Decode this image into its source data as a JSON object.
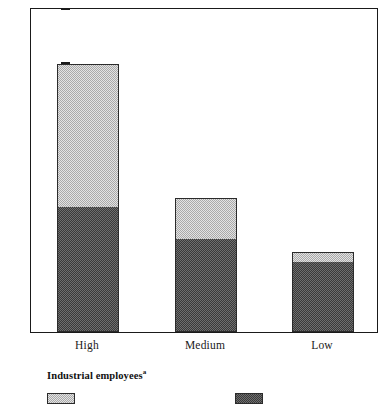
{
  "chart_data": {
    "type": "bar",
    "subtype": "stacked-vertical",
    "title": "",
    "xlabel": "",
    "ylabel": "",
    "ylim": [
      0,
      300
    ],
    "yticks": [
      0,
      50,
      100,
      150,
      200,
      250,
      300
    ],
    "ytick_labels": [
      "0",
      "50",
      "100",
      "150",
      "200",
      "250",
      "300"
    ],
    "grid": false,
    "legend_position": "below-plot",
    "categories": [
      "High",
      "Medium",
      "Low"
    ],
    "series": [
      {
        "name": "series-dark",
        "swatch": "dark",
        "values": [
          115,
          86,
          65
        ]
      },
      {
        "name": "series-light",
        "swatch": "light",
        "values": [
          132,
          38,
          9
        ]
      }
    ],
    "totals": [
      247,
      124,
      74
    ],
    "annotations": []
  },
  "axis": {
    "y": {
      "ticks": [
        {
          "label": "300",
          "value": 300
        },
        {
          "label": "250",
          "value": 250
        },
        {
          "label": "200",
          "value": 200
        },
        {
          "label": "150",
          "value": 150
        },
        {
          "label": "100",
          "value": 100
        },
        {
          "label": "50",
          "value": 50
        },
        {
          "label": "0",
          "value": 0
        }
      ]
    },
    "x": {
      "categories": [
        {
          "label": "High"
        },
        {
          "label": "Medium"
        },
        {
          "label": "Low"
        }
      ]
    }
  },
  "legend": {
    "title": "Industrial employees",
    "title_superscript": "a",
    "entries": [
      {
        "swatch": "light",
        "label": ""
      },
      {
        "swatch": "dark",
        "label": ""
      }
    ]
  },
  "colors": {
    "light_fill": "#c8c8c8",
    "dark_fill": "#4a4a4a",
    "outline": "#2b2b2b",
    "axis": "#1a1a1a",
    "background": "#ffffff"
  }
}
